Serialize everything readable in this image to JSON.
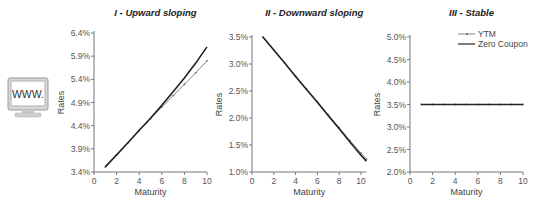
{
  "icon": {
    "name": "www-monitor-icon",
    "label": "WWW."
  },
  "colors": {
    "zero": "#222222",
    "ytm": "#666666",
    "axis": "#777777"
  },
  "legend": {
    "items": [
      {
        "label": "YTM",
        "key": "ytm"
      },
      {
        "label": "Zero Coupon",
        "key": "zero"
      }
    ]
  },
  "chart_data": [
    {
      "type": "line",
      "title": "I - Upward sloping",
      "xlabel": "Maturity",
      "ylabel": "Rates",
      "xlim": [
        0,
        10
      ],
      "ylim": [
        3.4,
        6.4
      ],
      "xticks": [
        0,
        2,
        4,
        6,
        8,
        10
      ],
      "yticks": [
        "3.4%",
        "3.9%",
        "4.4%",
        "4.9%",
        "5.4%",
        "5.9%",
        "6.4%"
      ],
      "ytick_values": [
        3.4,
        3.9,
        4.4,
        4.9,
        5.4,
        5.9,
        6.4
      ],
      "grid": false,
      "series": [
        {
          "name": "YTM",
          "x": [
            1,
            2,
            3,
            4,
            5,
            6,
            7,
            8,
            9,
            10
          ],
          "values": [
            3.51,
            3.77,
            4.03,
            4.29,
            4.55,
            4.8,
            5.05,
            5.29,
            5.54,
            5.8
          ]
        },
        {
          "name": "Zero Coupon",
          "x": [
            1,
            2,
            3,
            4,
            5,
            6,
            7,
            8,
            9,
            10
          ],
          "values": [
            3.51,
            3.77,
            4.03,
            4.3,
            4.56,
            4.84,
            5.13,
            5.43,
            5.75,
            6.1
          ]
        }
      ],
      "frame": {
        "x0": 94,
        "x1": 207,
        "y0": 172,
        "y1": 33,
        "xmaxAxis": 10
      }
    },
    {
      "type": "line",
      "title": "II - Downward sloping",
      "xlabel": "Maturity",
      "ylabel": "Rates",
      "xlim": [
        0,
        10.5
      ],
      "ylim": [
        1.0,
        3.6
      ],
      "xticks": [
        0,
        2,
        4,
        6,
        8,
        10
      ],
      "yticks": [
        "1.0%",
        "1.5%",
        "2.0%",
        "2.5%",
        "3.0%",
        "3.5%"
      ],
      "ytick_values": [
        1.0,
        1.5,
        2.0,
        2.5,
        3.0,
        3.5
      ],
      "grid": false,
      "series": [
        {
          "name": "YTM",
          "x": [
            1,
            2,
            3,
            4,
            5,
            6,
            7,
            8,
            9,
            10,
            10.5
          ],
          "values": [
            3.5,
            3.26,
            3.02,
            2.78,
            2.54,
            2.3,
            2.06,
            1.82,
            1.58,
            1.35,
            1.24
          ]
        },
        {
          "name": "Zero Coupon",
          "x": [
            1,
            2,
            3,
            4,
            5,
            6,
            7,
            8,
            9,
            10,
            10.5
          ],
          "values": [
            3.5,
            3.26,
            3.02,
            2.77,
            2.53,
            2.29,
            2.04,
            1.8,
            1.55,
            1.31,
            1.2
          ]
        }
      ],
      "frame": {
        "x0": 252,
        "x1": 361,
        "y0": 172,
        "y1": 37,
        "ybase": 1.0,
        "ystep": 0.5,
        "xmaxAxis": 10.5
      }
    },
    {
      "type": "line",
      "title": "III - Stable",
      "xlabel": "Maturity",
      "ylabel": "Rates",
      "xlim": [
        0,
        10
      ],
      "ylim": [
        2.0,
        5.0
      ],
      "xticks": [
        0,
        2,
        4,
        6,
        8,
        10
      ],
      "yticks": [
        "2.0%",
        "2.5%",
        "3.0%",
        "3.5%",
        "4.0%",
        "4.5%",
        "5.0%"
      ],
      "ytick_values": [
        2.0,
        2.5,
        3.0,
        3.5,
        4.0,
        4.5,
        5.0
      ],
      "grid": false,
      "legend_position": "upper right",
      "series": [
        {
          "name": "YTM",
          "x": [
            1,
            2,
            3,
            4,
            5,
            6,
            7,
            8,
            9,
            10
          ],
          "values": [
            3.5,
            3.5,
            3.5,
            3.5,
            3.5,
            3.5,
            3.5,
            3.5,
            3.5,
            3.5
          ]
        },
        {
          "name": "Zero Coupon",
          "x": [
            1,
            2,
            3,
            4,
            5,
            6,
            7,
            8,
            9,
            10
          ],
          "values": [
            3.5,
            3.5,
            3.5,
            3.5,
            3.5,
            3.5,
            3.5,
            3.5,
            3.5,
            3.5
          ]
        }
      ],
      "frame": {
        "x0": 410,
        "x1": 523,
        "y0": 172,
        "y1": 37,
        "xmaxAxis": 10
      }
    }
  ]
}
